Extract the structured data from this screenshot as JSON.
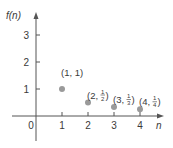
{
  "chart_data": {
    "type": "scatter",
    "title": "",
    "xlabel": "n",
    "ylabel": "f(n)",
    "x_ticks": [
      "0",
      "1",
      "2",
      "3",
      "4"
    ],
    "y_ticks": [
      "1",
      "2",
      "3"
    ],
    "xlim": [
      -0.7,
      4.8
    ],
    "ylim": [
      -1.1,
      3.6
    ],
    "grid": false,
    "points": [
      {
        "x": 1,
        "y": 1,
        "label_prefix": "(1, ",
        "label_num": "1",
        "label_den": "",
        "label_suffix": ")"
      },
      {
        "x": 2,
        "y": 0.5,
        "label_prefix": "(2, ",
        "label_num": "1",
        "label_den": "2",
        "label_suffix": ")"
      },
      {
        "x": 3,
        "y": 0.3333,
        "label_prefix": "(3, ",
        "label_num": "1",
        "label_den": "3",
        "label_suffix": ")"
      },
      {
        "x": 4,
        "y": 0.25,
        "label_prefix": "(4, ",
        "label_num": "1",
        "label_den": "4",
        "label_suffix": ")"
      }
    ],
    "colors": {
      "axis": "#555555",
      "point": "#9a9a9a",
      "text": "#3a3a3a"
    }
  }
}
